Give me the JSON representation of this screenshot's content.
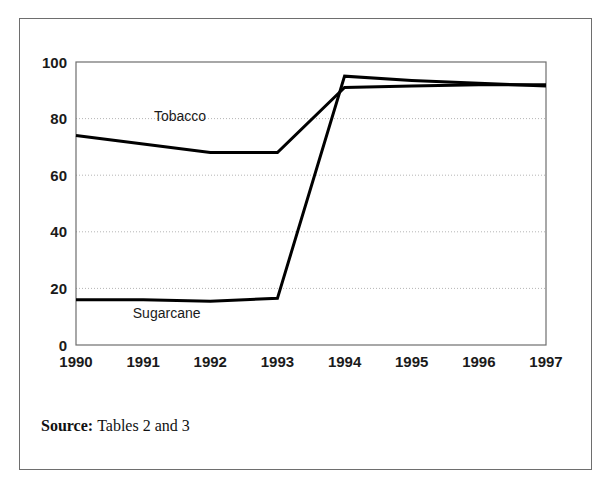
{
  "figure": {
    "source_label": "Source:",
    "source_text": "Tables 2 and 3",
    "frame_color": "#6e6e6e",
    "line_color": "#000000",
    "grid_color": "#b5b5b5",
    "background": "#ffffff"
  },
  "chart_data": {
    "type": "line",
    "title": "",
    "subtitle": "",
    "xlabel": "",
    "ylabel": "",
    "categories": [
      "1990",
      "1991",
      "1992",
      "1993",
      "1994",
      "1995",
      "1996",
      "1997"
    ],
    "x": [
      1990,
      1991,
      1992,
      1993,
      1994,
      1995,
      1996,
      1997
    ],
    "series": [
      {
        "name": "Tobacco",
        "values": [
          74,
          71,
          68,
          68,
          91,
          91.5,
          92,
          92
        ],
        "color": "#000000",
        "label_position": {
          "x": 1991.55,
          "y": 79
        }
      },
      {
        "name": "Sugarcane",
        "values": [
          16,
          16,
          15.5,
          16.5,
          95,
          93.5,
          92.5,
          91.5
        ],
        "color": "#000000",
        "label_position": {
          "x": 1991.35,
          "y": 9.5
        }
      }
    ],
    "xlim": [
      1990,
      1997
    ],
    "ylim": [
      0,
      100
    ],
    "yticks": [
      0,
      20,
      40,
      60,
      80,
      100
    ],
    "ytick_labels": [
      "0",
      "20",
      "40",
      "60",
      "80",
      "100"
    ],
    "xticks": [
      1990,
      1991,
      1992,
      1993,
      1994,
      1995,
      1996,
      1997
    ],
    "xtick_labels": [
      "1990",
      "1991",
      "1992",
      "1993",
      "1994",
      "1995",
      "1996",
      "1997"
    ],
    "grid": {
      "horizontal": true,
      "vertical": false,
      "style": "dotted"
    },
    "legend": {
      "visible": false,
      "position": "inline-labels"
    }
  }
}
